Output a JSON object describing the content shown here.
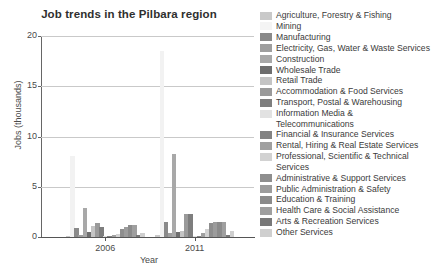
{
  "chart_data": {
    "type": "bar",
    "title": "Job trends in the Pilbara region",
    "xlabel": "Year",
    "ylabel": "Jobs (thousands)",
    "ylim": [
      0,
      20
    ],
    "yticks": [
      0,
      5,
      10,
      15,
      20
    ],
    "grid": true,
    "legend_position": "right",
    "categories": [
      "2006",
      "2011"
    ],
    "xtick_labels": [
      "2006",
      "2011"
    ],
    "series": [
      {
        "name": "Agriculture, Forestry & Fishing",
        "color": "#c9c9c9",
        "values": [
          0.15,
          0.18
        ]
      },
      {
        "name": "Mining",
        "color": "#f2f2f2",
        "values": [
          8.1,
          18.5
        ]
      },
      {
        "name": "Manufacturing",
        "color": "#8a8a8a",
        "values": [
          0.85,
          1.45
        ]
      },
      {
        "name": "Electricity, Gas, Water & Waste Services",
        "color": "#9e9e9e",
        "values": [
          0.2,
          0.35
        ]
      },
      {
        "name": "Construction",
        "color": "#a8a8a8",
        "values": [
          2.85,
          8.3
        ]
      },
      {
        "name": "Wholesale Trade",
        "color": "#6e6e6e",
        "values": [
          0.45,
          0.5
        ]
      },
      {
        "name": "Retail Trade",
        "color": "#c4c4c4",
        "values": [
          1.05,
          0.6
        ]
      },
      {
        "name": "Accommodation & Food Services",
        "color": "#9a9a9a",
        "values": [
          1.4,
          2.25
        ]
      },
      {
        "name": "Transport, Postal & Warehousing",
        "color": "#7e7e7e",
        "values": [
          0.95,
          2.3
        ]
      },
      {
        "name": "Information Media &\nTelecommunications",
        "color": "#e2e2e2",
        "values": [
          0.12,
          0.12
        ]
      },
      {
        "name": "Financial & Insurance Services",
        "color": "#838383",
        "values": [
          0.1,
          0.1
        ]
      },
      {
        "name": "Rental, Hiring & Real Estate Services",
        "color": "#a0a0a0",
        "values": [
          0.25,
          0.35
        ]
      },
      {
        "name": "Professional, Scientific & Technical\nServices",
        "color": "#d2d2d2",
        "values": [
          0.3,
          0.75
        ]
      },
      {
        "name": "Administrative & Support Services",
        "color": "#8e8e8e",
        "values": [
          0.75,
          1.35
        ]
      },
      {
        "name": "Public Administration & Safety",
        "color": "#9c9c9c",
        "values": [
          1.0,
          1.5
        ]
      },
      {
        "name": "Education & Training",
        "color": "#8b8b8b",
        "values": [
          1.15,
          1.45
        ]
      },
      {
        "name": "Health Care & Social Assistance",
        "color": "#9f9f9f",
        "values": [
          1.2,
          1.5
        ]
      },
      {
        "name": "Arts & Recreation Services",
        "color": "#787878",
        "values": [
          0.2,
          0.22
        ]
      },
      {
        "name": "Other Services",
        "color": "#cfcfcf",
        "values": [
          0.35,
          0.55
        ]
      }
    ]
  },
  "legend": [
    {
      "label": "Agriculture, Forestry & Fishing",
      "color": "#c9c9c9"
    },
    {
      "label": "Mining",
      "color": "#f4f4f4"
    },
    {
      "label": "Manufacturing",
      "color": "#8a8a8a"
    },
    {
      "label": "Electricity, Gas, Water & Waste Services",
      "color": "#9e9e9e"
    },
    {
      "label": "Construction",
      "color": "#a8a8a8"
    },
    {
      "label": "Wholesale Trade",
      "color": "#6e6e6e"
    },
    {
      "label": "Retail Trade",
      "color": "#c4c4c4"
    },
    {
      "label": "Accommodation & Food Services",
      "color": "#9a9a9a"
    },
    {
      "label": "Transport, Postal & Warehousing",
      "color": "#7e7e7e"
    },
    {
      "label": "Information Media &\nTelecommunications",
      "color": "#e2e2e2"
    },
    {
      "label": "Financial & Insurance Services",
      "color": "#838383"
    },
    {
      "label": "Rental, Hiring & Real Estate Services",
      "color": "#a0a0a0"
    },
    {
      "label": "Professional, Scientific & Technical\nServices",
      "color": "#d2d2d2"
    },
    {
      "label": "Administrative & Support Services",
      "color": "#8e8e8e"
    },
    {
      "label": "Public Administration & Safety",
      "color": "#9c9c9c"
    },
    {
      "label": "Education & Training",
      "color": "#8b8b8b"
    },
    {
      "label": "Health Care & Social Assistance",
      "color": "#9f9f9f"
    },
    {
      "label": "Arts & Recreation Services",
      "color": "#787878"
    },
    {
      "label": "Other Services",
      "color": "#cfcfcf"
    }
  ]
}
